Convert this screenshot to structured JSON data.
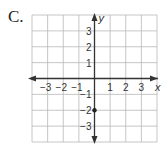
{
  "option_label": "C.",
  "chart_data": {
    "type": "scatter",
    "title": "",
    "xlabel": "x",
    "ylabel": "y",
    "xlim": [
      -4,
      4
    ],
    "ylim": [
      -4,
      4
    ],
    "grid": true,
    "x_tick_labels": [
      "−3",
      "−2",
      "−1",
      "1",
      "2",
      "3"
    ],
    "x_ticks": [
      -3,
      -2,
      -1,
      1,
      2,
      3
    ],
    "y_tick_labels": [
      "3",
      "2",
      "1",
      "−1",
      "−2",
      "−3"
    ],
    "y_ticks": [
      3,
      2,
      1,
      -1,
      -2,
      -3
    ],
    "points": [
      {
        "x": 0,
        "y": -2
      }
    ],
    "arrows": {
      "x_axis": "both",
      "y_axis": "both"
    }
  },
  "colors": {
    "grid": "#b8b8b8",
    "axis": "#333333",
    "point": "#222222"
  }
}
